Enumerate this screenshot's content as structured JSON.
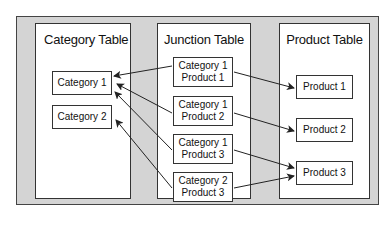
{
  "panels": {
    "category": {
      "title": "Category Table",
      "items": [
        "Category 1",
        "Category 2"
      ]
    },
    "junction": {
      "title": "Junction Table",
      "items": [
        {
          "category": "Category 1",
          "product": "Product 1"
        },
        {
          "category": "Category 1",
          "product": "Product 2"
        },
        {
          "category": "Category 1",
          "product": "Product 3"
        },
        {
          "category": "Category 2",
          "product": "Product 3"
        }
      ]
    },
    "product": {
      "title": "Product Table",
      "items": [
        "Product 1",
        "Product 2",
        "Product 3"
      ]
    }
  },
  "relationships": [
    {
      "from": "junction-1",
      "to_category": "Category 1",
      "to_product": "Product 1"
    },
    {
      "from": "junction-2",
      "to_category": "Category 1",
      "to_product": "Product 2"
    },
    {
      "from": "junction-3",
      "to_category": "Category 1",
      "to_product": "Product 3"
    },
    {
      "from": "junction-4",
      "to_category": "Category 2",
      "to_product": "Product 3"
    }
  ],
  "colors": {
    "frame": "#d4d4d4",
    "panel": "#ffffff",
    "stroke": "#333333"
  }
}
